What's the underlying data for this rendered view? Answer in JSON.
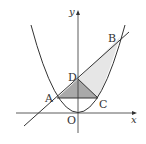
{
  "diagram": {
    "type": "function-graph",
    "axes": {
      "x_label": "x",
      "y_label": "y",
      "origin_label": "O"
    },
    "curves": [
      {
        "name": "parabola",
        "description": "upward parabola with vertex at origin"
      },
      {
        "name": "line",
        "description": "straight line through A, D and B"
      }
    ],
    "points": {
      "A": "A",
      "B": "B",
      "C": "C",
      "D": "D",
      "O": "O"
    },
    "regions": [
      {
        "name": "triangle-ADC",
        "shade": "#a9a9a9"
      },
      {
        "name": "region-DBC",
        "shade": "#e6e6e6"
      }
    ],
    "colors": {
      "stroke": "#333333",
      "dark_fill": "#a9a9a9",
      "light_fill": "#e6e6e6"
    }
  }
}
